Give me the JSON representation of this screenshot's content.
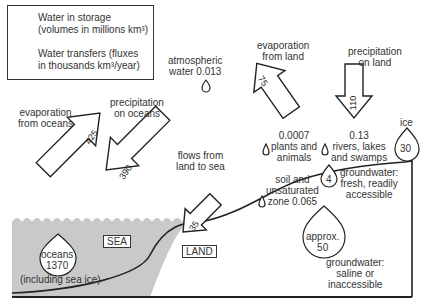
{
  "legend": {
    "storage_line1": "Water in storage",
    "storage_line2": "(volumes in millions km³)",
    "transfer_line1": "Water transfers (fluxes",
    "transfer_line2": "in thousands km³/year)",
    "storage_icon": "droplet-icon",
    "transfer_icon": "arrow-icon"
  },
  "region_labels": {
    "sea": "SEA",
    "land": "LAND"
  },
  "flows": [
    {
      "id": "evap_oceans",
      "label1": "evaporation",
      "label2": "from oceans",
      "value": "425"
    },
    {
      "id": "precip_oceans",
      "label1": "precipitation",
      "label2": "on oceans",
      "value": "390"
    },
    {
      "id": "land_to_sea",
      "label1": "flows from",
      "label2": "land to sea",
      "value": "35"
    },
    {
      "id": "evap_land",
      "label1": "evaporation",
      "label2": "from land",
      "value": "75"
    },
    {
      "id": "precip_land",
      "label1": "precipitation",
      "label2": "on land",
      "value": "110"
    }
  ],
  "storages": [
    {
      "id": "atmospheric",
      "label1": "atmospheric",
      "label2": "water 0.013"
    },
    {
      "id": "plants",
      "value": "0.0007",
      "label1": "plants and",
      "label2": "animals"
    },
    {
      "id": "rivers",
      "value": "0.13",
      "label1": "rivers, lakes",
      "label2": "and swamps"
    },
    {
      "id": "ice",
      "label": "ice",
      "value": "30"
    },
    {
      "id": "soil",
      "label1": "soil and",
      "label2": "unsaturated",
      "label3": "zone 0.065"
    },
    {
      "id": "groundwater_fresh",
      "value": "4",
      "label1": "groundwater:",
      "label2": "fresh, readily",
      "label3": "accessible"
    },
    {
      "id": "groundwater_saline",
      "value1": "approx.",
      "value2": "50",
      "label1": "groundwater:",
      "label2": "saline or",
      "label3": "inaccessible"
    },
    {
      "id": "oceans",
      "value1": "oceans",
      "value2": "1370",
      "label": "(including sea ice)"
    }
  ],
  "colors": {
    "sea": "#c8c8c8",
    "line": "#222222",
    "background": "#ffffff"
  }
}
